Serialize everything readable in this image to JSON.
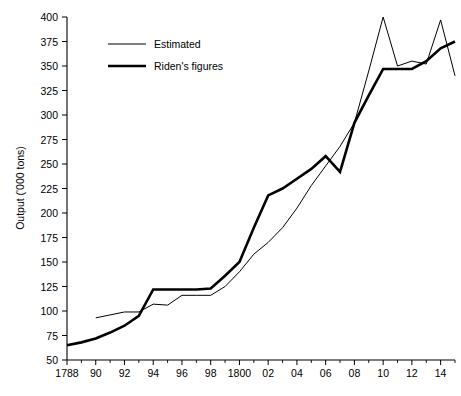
{
  "chart_data": {
    "type": "line",
    "title": "",
    "xlabel": "",
    "ylabel": "Output ('000 tons)",
    "xlim": [
      1788,
      1815
    ],
    "ylim": [
      50,
      400
    ],
    "ytick_step": 25,
    "xtick_step": 1,
    "grid": false,
    "legend_position": "upper-left-inside",
    "ytick_labels": [
      "400",
      "375",
      "350",
      "325",
      "300",
      "275",
      "250",
      "225",
      "200",
      "175",
      "150",
      "125",
      "100",
      "75",
      "50"
    ],
    "ytick_values": [
      400,
      375,
      350,
      325,
      300,
      275,
      250,
      225,
      200,
      175,
      150,
      125,
      100,
      75,
      50
    ],
    "xtick_labels": [
      "1788",
      "90",
      "92",
      "94",
      "96",
      "98",
      "1800",
      "02",
      "04",
      "06",
      "08",
      "10",
      "12",
      "14"
    ],
    "xtick_values": [
      1788,
      1790,
      1792,
      1794,
      1796,
      1798,
      1800,
      1802,
      1804,
      1806,
      1808,
      1810,
      1812,
      1814
    ],
    "x": [
      1788,
      1789,
      1790,
      1791,
      1792,
      1793,
      1794,
      1795,
      1796,
      1797,
      1798,
      1799,
      1800,
      1801,
      1802,
      1803,
      1804,
      1805,
      1806,
      1807,
      1808,
      1809,
      1810,
      1811,
      1812,
      1813,
      1814,
      1815
    ],
    "series": [
      {
        "name": "Estimated",
        "line_style": "thin",
        "x": [
          1790,
          1791,
          1792,
          1793,
          1794,
          1795,
          1796,
          1797,
          1798,
          1799,
          1800,
          1801,
          1802,
          1803,
          1804,
          1805,
          1806,
          1807,
          1808,
          1809,
          1810,
          1811,
          1812,
          1813,
          1814,
          1815
        ],
        "values": [
          93,
          96,
          99,
          99,
          107,
          106,
          116,
          116,
          116,
          125,
          140,
          158,
          170,
          185,
          205,
          228,
          248,
          268,
          292,
          345,
          400,
          350,
          355,
          352,
          397,
          340
        ]
      },
      {
        "name": "Riden's figures",
        "line_style": "thick",
        "x": [
          1788,
          1789,
          1790,
          1791,
          1792,
          1793,
          1794,
          1795,
          1796,
          1797,
          1798,
          1799,
          1800,
          1801,
          1802,
          1803,
          1804,
          1805,
          1806,
          1807,
          1808,
          1809,
          1810,
          1811,
          1812,
          1813,
          1814,
          1815
        ],
        "values": [
          65,
          68,
          72,
          78,
          85,
          95,
          122,
          122,
          122,
          122,
          123,
          136,
          150,
          185,
          218,
          225,
          235,
          245,
          258,
          242,
          292,
          320,
          347,
          347,
          347,
          355,
          368,
          375
        ]
      }
    ]
  },
  "legend": {
    "items": [
      {
        "label": "Estimated",
        "style": "thin"
      },
      {
        "label": "Riden's figures",
        "style": "thick"
      }
    ]
  },
  "axes": {
    "y_title": "Output ('000 tons)"
  }
}
